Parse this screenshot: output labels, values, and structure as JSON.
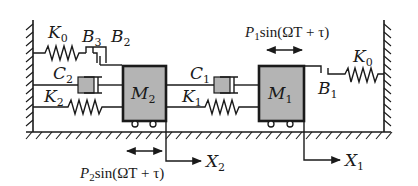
{
  "diagram": {
    "masses": [
      {
        "id": "M1",
        "label": "M",
        "sub": "1"
      },
      {
        "id": "M2",
        "label": "M",
        "sub": "2"
      }
    ],
    "springs": {
      "K0_left": {
        "label": "K",
        "sub": "0"
      },
      "K0_right": {
        "label": "K",
        "sub": "0"
      },
      "K1": {
        "label": "K",
        "sub": "1"
      },
      "K2": {
        "label": "K",
        "sub": "2"
      }
    },
    "dampers": {
      "C1": {
        "label": "C",
        "sub": "1"
      },
      "C2": {
        "label": "C",
        "sub": "2"
      }
    },
    "clearances": {
      "B1": {
        "label": "B",
        "sub": "1"
      },
      "B2": {
        "label": "B",
        "sub": "2"
      },
      "B3": {
        "label": "B",
        "sub": "3"
      }
    },
    "forces": {
      "P1": {
        "prefix": "P",
        "sub": "1",
        "expr": "sin(ΩT + τ)"
      },
      "P2": {
        "prefix": "P",
        "sub": "2",
        "expr": "sin(ΩT + τ)"
      }
    },
    "displacements": {
      "X1": {
        "label": "X",
        "sub": "1"
      },
      "X2": {
        "label": "X",
        "sub": "2"
      }
    },
    "colors": {
      "line": "#1a1a1a",
      "mass_fill": "#b4b4b4",
      "background": "#ffffff"
    }
  }
}
